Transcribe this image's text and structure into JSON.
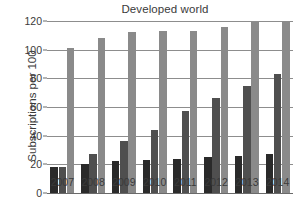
{
  "chart_data": {
    "type": "bar",
    "title": "Developed world",
    "xlabel": "",
    "ylabel": "Subscriptions per 100",
    "categories": [
      "2007",
      "2008",
      "2009",
      "2010",
      "2011",
      "2012",
      "2013",
      "2014"
    ],
    "series": [
      {
        "name": "series-1",
        "color": "#2a2a2a",
        "values": [
          18,
          20,
          22,
          23,
          24,
          25,
          26,
          27
        ]
      },
      {
        "name": "series-2",
        "color": "#4f4f4f",
        "values": [
          18,
          27,
          36,
          44,
          57,
          66,
          75,
          83
        ]
      },
      {
        "name": "series-3",
        "color": "#8a8a8a",
        "values": [
          101,
          108,
          112,
          113,
          113,
          116,
          119,
          120
        ]
      }
    ],
    "ylim": [
      0,
      120
    ],
    "yticks": [
      0,
      20,
      40,
      60,
      80,
      100,
      120
    ],
    "grid": true,
    "legend": "none"
  }
}
